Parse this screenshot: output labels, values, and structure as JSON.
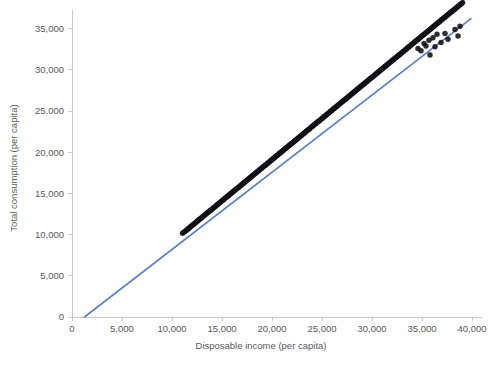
{
  "chart_data": {
    "type": "scatter",
    "title": "",
    "subtitle": "",
    "xlabel": "Disposable income (per capita)",
    "ylabel": "Total consumption (per capita)",
    "xlim": [
      0,
      41000
    ],
    "ylim": [
      0,
      37200
    ],
    "xticks": [
      0,
      5000,
      10000,
      15000,
      20000,
      25000,
      30000,
      35000,
      40000
    ],
    "yticks": [
      0,
      5000,
      10000,
      15000,
      20000,
      25000,
      30000,
      35000
    ],
    "xticklabels": [
      "0",
      "5,000",
      "10,000",
      "15,000",
      "20,000",
      "25,000",
      "30,000",
      "35,000",
      "40,000"
    ],
    "yticklabels": [
      "0",
      "5,000",
      "10,000",
      "15,000",
      "20,000",
      "25,000",
      "30,000",
      "35,000"
    ],
    "grid": false,
    "legend": null,
    "legend_position": "none",
    "marker_color": "#111018",
    "marker_size": 5.5,
    "marker_opacity": 0.88,
    "series": [
      {
        "name": "Households",
        "type": "scatter",
        "x": [
          11050,
          11180,
          11320,
          11410,
          11560,
          11640,
          11720,
          11830,
          11910,
          12020,
          12140,
          12230,
          12340,
          12460,
          12550,
          12660,
          12740,
          12850,
          12960,
          13040,
          13150,
          13260,
          13340,
          13450,
          13560,
          13640,
          13750,
          13860,
          13940,
          14050,
          14160,
          14240,
          14350,
          14460,
          14540,
          14650,
          14760,
          14840,
          14950,
          15060,
          15140,
          15250,
          15360,
          15440,
          15550,
          15660,
          15740,
          15850,
          15960,
          16040,
          16150,
          16260,
          16340,
          16450,
          16560,
          16640,
          16750,
          16860,
          16940,
          17050,
          17160,
          17240,
          17350,
          17460,
          17540,
          17650,
          17760,
          17840,
          17950,
          18060,
          18140,
          18250,
          18360,
          18440,
          18550,
          18660,
          18740,
          18850,
          18960,
          19040,
          19150,
          19260,
          19340,
          19450,
          19560,
          19640,
          19750,
          19860,
          19940,
          20050,
          20160,
          20240,
          20350,
          20460,
          20540,
          20650,
          20760,
          20840,
          20950,
          21060,
          21140,
          21250,
          21360,
          21440,
          21550,
          21660,
          21740,
          21850,
          21960,
          22040,
          22150,
          22260,
          22340,
          22450,
          22560,
          22640,
          22750,
          22860,
          22940,
          23050,
          23160,
          23240,
          23350,
          23460,
          23540,
          23650,
          23760,
          23840,
          23950,
          24060,
          24140,
          24250,
          24360,
          24440,
          24550,
          24660,
          24740,
          24850,
          24960,
          25040,
          25150,
          25260,
          25340,
          25450,
          25560,
          25640,
          25750,
          25860,
          25940,
          26050,
          26160,
          26240,
          26350,
          26460,
          26540,
          26650,
          26760,
          26840,
          26950,
          27060,
          27140,
          27250,
          27360,
          27440,
          27550,
          27660,
          27740,
          27850,
          27960,
          28040,
          28150,
          28260,
          28340,
          28450,
          28560,
          28640,
          28750,
          28860,
          28940,
          29050,
          29160,
          29240,
          29350,
          29460,
          29540,
          29650,
          29760,
          29840,
          29950,
          30060,
          30140,
          30250,
          30360,
          30440,
          30550,
          30660,
          30740,
          30850,
          30960,
          31040,
          31150,
          31260,
          31340,
          31450,
          31560,
          31640,
          31750,
          31860,
          31940,
          32050,
          32160,
          32240,
          32350,
          32460,
          32540,
          32650,
          32760,
          32840,
          32950,
          33060,
          33140,
          33250,
          33360,
          33440,
          33550,
          33660,
          33740,
          33850,
          33960,
          34040,
          34150,
          34260,
          34340,
          34450,
          34560,
          34640,
          34750,
          34860,
          34940,
          35050,
          35160,
          35240,
          35350,
          35460,
          35540,
          35650,
          35760,
          35840,
          35950,
          36060,
          36140,
          36250,
          36360,
          36440,
          36550,
          36660,
          36740,
          36850,
          36960,
          37040,
          37150,
          37260,
          37340,
          37450,
          37560,
          37640,
          37750,
          37860,
          37940,
          38050,
          38160,
          38240,
          38350,
          38460,
          38540,
          38650,
          38760,
          38840,
          38950,
          39060,
          34600,
          34900,
          35200,
          35400,
          35700,
          36100,
          36500,
          37300,
          38300,
          38800,
          35800,
          36300,
          36900,
          37600,
          38600
        ],
        "y": [
          10150,
          10280,
          10410,
          10490,
          10650,
          10720,
          10810,
          10930,
          11000,
          11120,
          11240,
          11330,
          11440,
          11560,
          11640,
          11760,
          11830,
          11950,
          12060,
          12130,
          12250,
          12360,
          12430,
          12550,
          12660,
          12730,
          12850,
          12960,
          13030,
          13150,
          13260,
          13330,
          13450,
          13560,
          13630,
          13750,
          13860,
          13930,
          14050,
          14160,
          14230,
          14350,
          14460,
          14530,
          14650,
          14760,
          14830,
          14950,
          15060,
          15130,
          15250,
          15360,
          15430,
          15550,
          15660,
          15730,
          15850,
          15960,
          16030,
          16150,
          16260,
          16330,
          16450,
          16560,
          16630,
          16750,
          16860,
          16930,
          17050,
          17160,
          17230,
          17350,
          17460,
          17530,
          17650,
          17760,
          17830,
          17950,
          18060,
          18130,
          18250,
          18360,
          18430,
          18550,
          18660,
          18730,
          18850,
          18960,
          19030,
          19150,
          19260,
          19330,
          19450,
          19560,
          19630,
          19750,
          19860,
          19930,
          20050,
          20160,
          20230,
          20350,
          20460,
          20530,
          20650,
          20760,
          20830,
          20950,
          21060,
          21130,
          21250,
          21360,
          21430,
          21550,
          21660,
          21730,
          21850,
          21960,
          22030,
          22150,
          22260,
          22330,
          22450,
          22560,
          22630,
          22750,
          22860,
          22930,
          23050,
          23160,
          23230,
          23350,
          23460,
          23530,
          23650,
          23760,
          23830,
          23950,
          24060,
          24130,
          24250,
          24360,
          24430,
          24550,
          24660,
          24730,
          24850,
          24960,
          25030,
          25150,
          25260,
          25330,
          25450,
          25560,
          25630,
          25750,
          25860,
          25930,
          26050,
          26160,
          26230,
          26350,
          26460,
          26530,
          26650,
          26760,
          26830,
          26950,
          27060,
          27130,
          27250,
          27360,
          27430,
          27550,
          27660,
          27730,
          27850,
          27960,
          28030,
          28150,
          28260,
          28330,
          28450,
          28560,
          28630,
          28750,
          28860,
          28930,
          29050,
          29160,
          29230,
          29350,
          29460,
          29530,
          29650,
          29760,
          29830,
          29950,
          30060,
          30130,
          30250,
          30360,
          30430,
          30550,
          30660,
          30730,
          30850,
          30960,
          31030,
          31150,
          31260,
          31330,
          31450,
          31560,
          31630,
          31750,
          31860,
          31930,
          32050,
          32160,
          32230,
          32350,
          32460,
          32530,
          32650,
          32760,
          32830,
          32950,
          33060,
          33130,
          33250,
          33360,
          33430,
          33550,
          33660,
          33730,
          33850,
          33960,
          34030,
          34150,
          34260,
          34330,
          34450,
          34560,
          34630,
          34750,
          34860,
          34930,
          35050,
          35160,
          35230,
          35350,
          35460,
          35530,
          35650,
          35760,
          35830,
          35950,
          36060,
          36130,
          36250,
          36360,
          36430,
          36550,
          36660,
          36730,
          36850,
          36960,
          37030,
          37150,
          37260,
          37330,
          37450,
          37560,
          37630,
          37750,
          37860,
          37930,
          38050,
          38160,
          32600,
          32300,
          33200,
          32900,
          33600,
          33900,
          34300,
          34400,
          34900,
          35300,
          31800,
          32800,
          33300,
          33700,
          34100
        ]
      }
    ],
    "fit_line": {
      "name": "Linear fit",
      "color": "#5b7fc4",
      "width": 1.6,
      "x": [
        1250,
        39900
      ],
      "y": [
        0,
        36200
      ]
    }
  }
}
